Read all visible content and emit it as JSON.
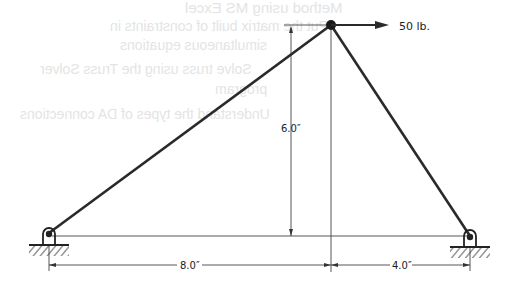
{
  "diagram": {
    "type": "truss",
    "load": {
      "label": "50 lb.",
      "direction": "right"
    },
    "dimensions": {
      "height": "6.0″",
      "left_span": "8.0″",
      "right_span": "4.0″"
    },
    "joints": [
      "top-apex",
      "left-pin-support",
      "right-pin-support"
    ],
    "members": [
      "left-diagonal-member",
      "right-diagonal-member"
    ]
  },
  "show_through_text": [
    "Method using MS Excel",
    "Put the matrix built of constraints in",
    "simultaneous equations",
    "Solve truss using the Truss Solver",
    "program",
    "Understand the types of DA connections",
    "connections"
  ],
  "colors": {
    "line": "#2a2a2a",
    "dim_line": "#555555",
    "ghost_text": "#e4e4e4"
  }
}
